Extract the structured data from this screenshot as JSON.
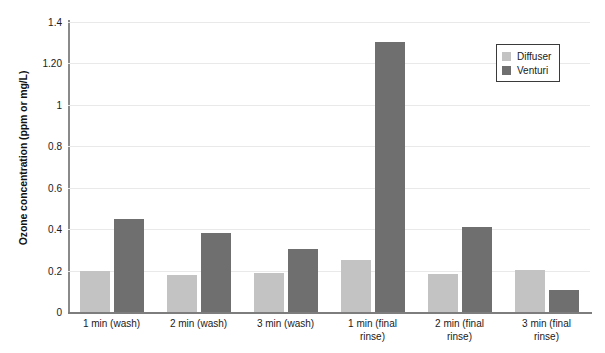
{
  "chart_data": {
    "type": "bar",
    "title": "",
    "xlabel": "",
    "ylabel": "Ozone concentration (ppm or mg/L)",
    "ylim": [
      0,
      1.4
    ],
    "ytick_labels": [
      "1.4",
      "1.20",
      "1",
      "0.8",
      "0.6",
      "0.4",
      "0.2",
      "0"
    ],
    "ytick_values": [
      1.4,
      1.2,
      1.0,
      0.8,
      0.6,
      0.4,
      0.2,
      0
    ],
    "grid": true,
    "legend_position": "top-right",
    "categories": [
      "1 min (wash)",
      "2 min (wash)",
      "3 min (wash)",
      "1 min (final rinse)",
      "2 min (final rinse)",
      "3 min (final rinse)"
    ],
    "category_lines": [
      [
        "1 min (wash)"
      ],
      [
        "2 min (wash)"
      ],
      [
        "3 min (wash)"
      ],
      [
        "1 min (final",
        "rinse)"
      ],
      [
        "2 min (final",
        "rinse)"
      ],
      [
        "3 min (final",
        "rinse)"
      ]
    ],
    "series": [
      {
        "name": "Diffuser",
        "color": "#c3c3c3",
        "values": [
          0.2,
          0.18,
          0.19,
          0.25,
          0.185,
          0.205
        ]
      },
      {
        "name": "Venturi",
        "color": "#6f6f6f",
        "values": [
          0.45,
          0.38,
          0.305,
          1.305,
          0.41,
          0.105
        ]
      }
    ]
  },
  "legend": {
    "entries": [
      {
        "label": "Diffuser",
        "color": "#c3c3c3"
      },
      {
        "label": "Venturi",
        "color": "#6f6f6f"
      }
    ]
  }
}
